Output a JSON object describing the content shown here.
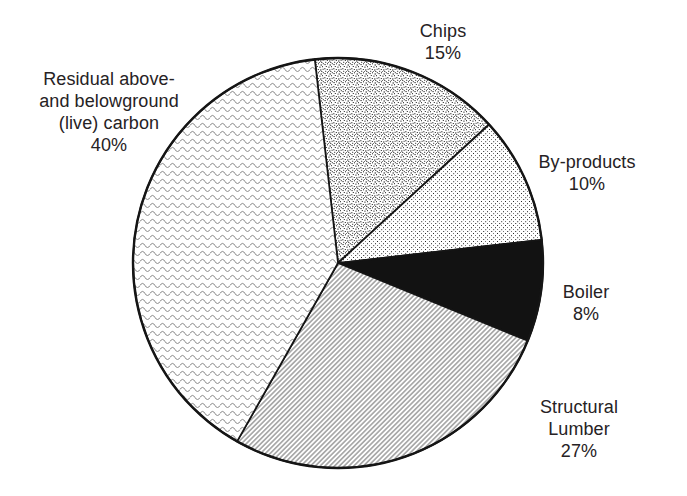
{
  "chart_data": {
    "type": "pie",
    "title": "",
    "legend": "none",
    "direction": "clockwise",
    "start_angle_deg": 96.5,
    "center_px": {
      "x": 338,
      "y": 263
    },
    "radius_px": 205,
    "colors": {
      "outline": "#151515",
      "solid": "#121212",
      "background": "#ffffff",
      "text": "#262224"
    },
    "slices": [
      {
        "label": "Chips",
        "percent": 15,
        "pattern": "stipple-dense"
      },
      {
        "label": "By-products",
        "percent": 10,
        "pattern": "dots-sparse"
      },
      {
        "label": "Boiler",
        "percent": 8,
        "pattern": "solid-black"
      },
      {
        "label": "Structural Lumber",
        "percent": 27,
        "pattern": "diagonal-lines"
      },
      {
        "label": "Residual above- and belowground (live) carbon",
        "percent": 40,
        "pattern": "wavy-lines"
      }
    ]
  },
  "labels": {
    "chips": "Chips\n15%",
    "byproducts": "By-products\n10%",
    "boiler": "Boiler\n8%",
    "structural": "Structural Lumber\n27%",
    "residual": "Residual above-\nand belowground\n(live) carbon\n40%"
  }
}
